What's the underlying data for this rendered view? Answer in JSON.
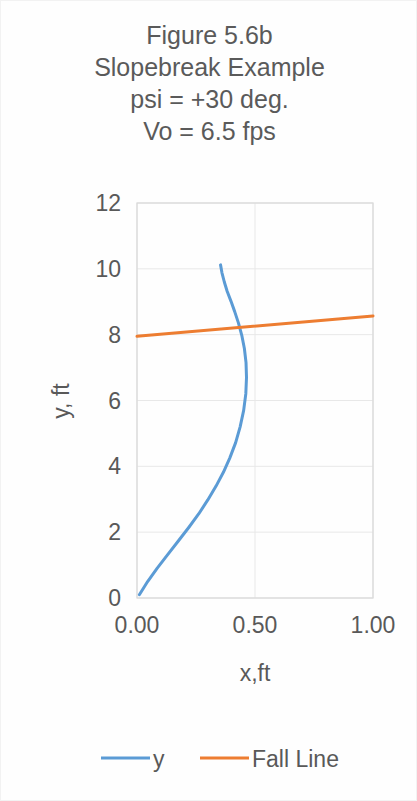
{
  "chart_data": {
    "type": "line",
    "title": "Figure 5.6b\nSlopebreak Example\npsi = +30 deg.\nVo = 6.5 fps",
    "title_lines": [
      "Figure 5.6b",
      "Slopebreak Example",
      "psi = +30 deg.",
      "Vo = 6.5 fps"
    ],
    "xlabel": "x,ft",
    "ylabel": "y, ft",
    "xlim": [
      0.0,
      1.0
    ],
    "ylim": [
      0,
      12
    ],
    "xticks": [
      "0.00",
      "0.50",
      "1.00"
    ],
    "xtick_values": [
      0.0,
      0.5,
      1.0
    ],
    "yticks": [
      "0",
      "2",
      "4",
      "6",
      "8",
      "10",
      "12"
    ],
    "ytick_values": [
      0,
      2,
      4,
      6,
      8,
      10,
      12
    ],
    "grid": true,
    "grid_axis": "both",
    "legend_position": "bottom",
    "series": [
      {
        "name": "y",
        "color": "#5b9bd5",
        "x": [
          0.01,
          0.045,
          0.085,
          0.13,
          0.175,
          0.22,
          0.262,
          0.3,
          0.335,
          0.366,
          0.393,
          0.418,
          0.437,
          0.452,
          0.461,
          0.464,
          0.462,
          0.455,
          0.444,
          0.43,
          0.414,
          0.398,
          0.382,
          0.37,
          0.36,
          0.354
        ],
        "y": [
          0.1,
          0.5,
          0.9,
          1.32,
          1.73,
          2.15,
          2.56,
          2.98,
          3.4,
          3.82,
          4.25,
          4.72,
          5.2,
          5.7,
          6.2,
          6.7,
          7.15,
          7.58,
          7.98,
          8.35,
          8.7,
          9.02,
          9.32,
          9.6,
          9.88,
          10.12
        ]
      },
      {
        "name": "Fall Line",
        "color": "#ed7d31",
        "x": [
          0.0,
          1.0
        ],
        "y": [
          7.95,
          8.57
        ]
      }
    ],
    "colors": {
      "series_y": "#5b9bd5",
      "series_fall_line": "#ed7d31",
      "grid": "#e8e8e8",
      "axis": "#d9d9d9",
      "text": "#595959",
      "background": "#ffffff"
    }
  },
  "legend": {
    "items": [
      {
        "label": "y",
        "color": "#5b9bd5"
      },
      {
        "label": "Fall Line",
        "color": "#ed7d31"
      }
    ]
  }
}
